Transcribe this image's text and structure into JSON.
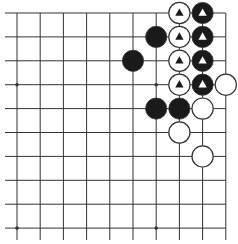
{
  "diagram": {
    "type": "go-board-fragment",
    "grid": {
      "cols": 10,
      "rows": 10,
      "x0": 17,
      "y0": 13,
      "dx": 23.2,
      "dy": 23.9,
      "line_color": "#333333",
      "edge_right": true,
      "edge_top": true
    },
    "star_points": [
      {
        "col": 0,
        "row": 3
      },
      {
        "col": 6,
        "row": 3
      },
      {
        "col": 0,
        "row": 9
      },
      {
        "col": 6,
        "row": 9
      }
    ],
    "stones": [
      {
        "col": 7,
        "row": 0,
        "color": "white",
        "mark": "triangle"
      },
      {
        "col": 8,
        "row": 0,
        "color": "black",
        "mark": "triangle"
      },
      {
        "col": 6,
        "row": 1,
        "color": "black",
        "mark": ""
      },
      {
        "col": 7,
        "row": 1,
        "color": "white",
        "mark": "triangle"
      },
      {
        "col": 8,
        "row": 1,
        "color": "black",
        "mark": "triangle"
      },
      {
        "col": 5,
        "row": 2,
        "color": "black",
        "mark": ""
      },
      {
        "col": 7,
        "row": 2,
        "color": "white",
        "mark": "triangle"
      },
      {
        "col": 8,
        "row": 2,
        "color": "black",
        "mark": "triangle"
      },
      {
        "col": 7,
        "row": 3,
        "color": "white",
        "mark": "triangle"
      },
      {
        "col": 8,
        "row": 3,
        "color": "black",
        "mark": "triangle"
      },
      {
        "col": 9,
        "row": 3,
        "color": "white",
        "mark": ""
      },
      {
        "col": 6,
        "row": 4,
        "color": "black",
        "mark": ""
      },
      {
        "col": 7,
        "row": 4,
        "color": "black",
        "mark": ""
      },
      {
        "col": 8,
        "row": 4,
        "color": "white",
        "mark": ""
      },
      {
        "col": 7,
        "row": 5,
        "color": "white",
        "mark": ""
      },
      {
        "col": 8,
        "row": 6,
        "color": "white",
        "mark": ""
      }
    ],
    "colors": {
      "black_stone": "#1a1a1a",
      "white_stone": "#ffffff",
      "stone_outline": "#333333"
    }
  }
}
